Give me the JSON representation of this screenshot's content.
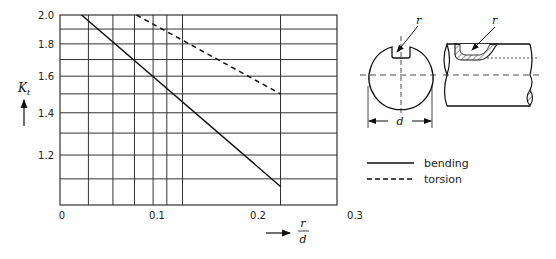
{
  "chart_data": {
    "type": "line",
    "title": "",
    "xlabel_num": "r",
    "xlabel_den": "d",
    "ylabel": "K",
    "ylabel_sub": "t",
    "y_scale": "log",
    "xlim": [
      0,
      0.28
    ],
    "ylim": [
      1.0,
      2.0
    ],
    "grid": true,
    "x_ticks": [
      {
        "value": 0,
        "label": "0"
      },
      {
        "value": 0.1,
        "label": "0.1"
      },
      {
        "value": 0.2,
        "label": "0.2"
      },
      {
        "value": 0.3,
        "label": "0.3"
      }
    ],
    "y_ticks": [
      {
        "value": 2.0,
        "label": "2.0"
      },
      {
        "value": 1.8,
        "label": "1.8"
      },
      {
        "value": 1.6,
        "label": "1.6"
      },
      {
        "value": 1.4,
        "label": "1.4"
      },
      {
        "value": 1.2,
        "label": "1.2"
      }
    ],
    "x_gridlines": [
      0.029,
      0.054,
      0.076,
      0.095,
      0.109,
      0.125,
      0.225
    ],
    "y_gridlines": [
      1.9,
      1.8,
      1.7,
      1.6,
      1.5,
      1.4,
      1.3,
      1.2,
      1.1
    ],
    "series": [
      {
        "name": "bending",
        "style": "solid",
        "x": [
          0.022,
          0.225
        ],
        "y": [
          2.0,
          1.07
        ]
      },
      {
        "name": "torsion",
        "style": "dashed",
        "x": [
          0.078,
          0.225
        ],
        "y": [
          2.0,
          1.5
        ]
      }
    ],
    "legend": {
      "position": "right",
      "entries": [
        {
          "label": "bending",
          "style": "solid"
        },
        {
          "label": "torsion",
          "style": "dashed"
        }
      ]
    },
    "annotations": {
      "cross_section_radius_label": "r",
      "cross_section_diameter_label": "d",
      "side_view_radius_label": "r"
    }
  },
  "colors": {
    "line": "#111111",
    "grid": "#333333",
    "hatch": "#333333"
  }
}
